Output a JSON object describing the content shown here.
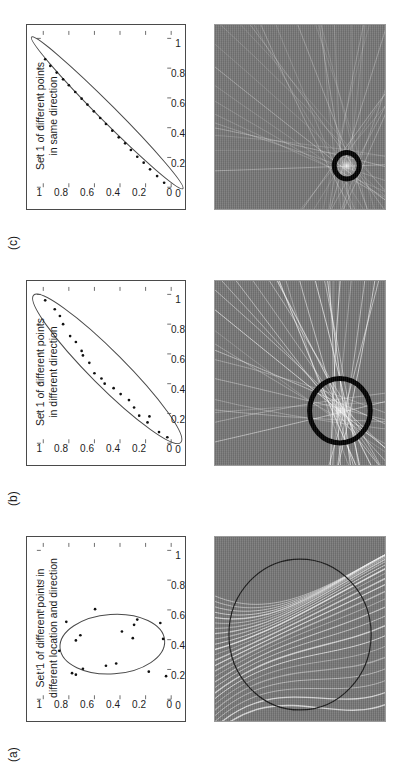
{
  "figure": {
    "type": "scientific-figure-3-panel",
    "orientation": "rotated-90-ccw",
    "background_color": "#ffffff",
    "axis_color": "#4a4a4a",
    "image_background_color": "#787878",
    "streak_color": "#ffffff",
    "marker_circle_color": "#000000"
  },
  "axis": {
    "x_ticks": [
      "0",
      "0.2",
      "0.4",
      "0.6",
      "0.8",
      "1"
    ],
    "y_ticks": [
      "0",
      "0.2",
      "0.4",
      "0.6",
      "0.8",
      "1"
    ],
    "xlim": [
      0,
      1.05
    ],
    "ylim": [
      0,
      1.05
    ]
  },
  "panels": [
    {
      "label": "(a)",
      "caption_line1": "Set 1 of different points in",
      "caption_line2": "different location and direction",
      "ellipse": {
        "cx": 0.37,
        "cy": 0.46,
        "rx": 0.2,
        "ry": 0.41,
        "rot": -4,
        "stroke": "#4a4a4a",
        "width": 1
      },
      "points": [
        [
          0.605,
          0.595
        ],
        [
          0.535,
          0.265
        ],
        [
          0.52,
          0.82
        ],
        [
          0.512,
          0.085
        ],
        [
          0.5,
          0.29
        ],
        [
          0.455,
          0.385
        ],
        [
          0.43,
          0.71
        ],
        [
          0.41,
          0.3
        ],
        [
          0.405,
          0.063
        ],
        [
          0.395,
          0.745
        ],
        [
          0.325,
          0.875
        ],
        [
          0.24,
          0.43
        ],
        [
          0.225,
          0.51
        ],
        [
          0.205,
          0.69
        ],
        [
          0.185,
          0.175
        ],
        [
          0.175,
          0.775
        ],
        [
          0.165,
          0.745
        ],
        [
          0.155,
          0.04
        ]
      ],
      "image": {
        "kind": "backprojection-streaks-large-circle",
        "circle": {
          "cx": 0.47,
          "cy": 0.5,
          "r": 0.41,
          "stroke": "#1a1a1a",
          "width": 1.2
        },
        "focus": null
      }
    },
    {
      "label": "(b)",
      "caption_line1": "Set 1 of different points",
      "caption_line2": "in different direction",
      "ellipse": {
        "cx": 0.5,
        "cy": 0.5,
        "rx": 0.7,
        "ry": 0.135,
        "rot": -45,
        "stroke": "#4a4a4a",
        "width": 1
      },
      "points": [
        [
          0.04,
          0.03
        ],
        [
          0.075,
          0.095
        ],
        [
          0.14,
          0.185
        ],
        [
          0.18,
          0.17
        ],
        [
          0.185,
          0.25
        ],
        [
          0.24,
          0.29
        ],
        [
          0.29,
          0.33
        ],
        [
          0.33,
          0.395
        ],
        [
          0.37,
          0.45
        ],
        [
          0.4,
          0.52
        ],
        [
          0.435,
          0.545
        ],
        [
          0.47,
          0.6
        ],
        [
          0.54,
          0.64
        ],
        [
          0.59,
          0.69
        ],
        [
          0.62,
          0.7
        ],
        [
          0.68,
          0.745
        ],
        [
          0.72,
          0.79
        ],
        [
          0.8,
          0.845
        ],
        [
          0.855,
          0.87
        ],
        [
          0.9,
          0.91
        ],
        [
          0.96,
          0.985
        ]
      ],
      "image": {
        "kind": "converging-streaks-thick-circle",
        "circle": {
          "cx": 0.295,
          "cy": 0.265,
          "r": 0.175,
          "stroke": "#000000",
          "width": 5
        },
        "focus": {
          "cx": 0.295,
          "cy": 0.265
        }
      }
    },
    {
      "label": "(c)",
      "caption_line1": "Set 1 of different points",
      "caption_line2": "in same direction",
      "ellipse": {
        "cx": 0.5,
        "cy": 0.5,
        "rx": 0.72,
        "ry": 0.065,
        "rot": -45,
        "stroke": "#4a4a4a",
        "width": 1
      },
      "points": [
        [
          0.03,
          0.055
        ],
        [
          0.075,
          0.11
        ],
        [
          0.12,
          0.165
        ],
        [
          0.165,
          0.215
        ],
        [
          0.205,
          0.265
        ],
        [
          0.25,
          0.315
        ],
        [
          0.295,
          0.36
        ],
        [
          0.335,
          0.41
        ],
        [
          0.38,
          0.46
        ],
        [
          0.425,
          0.51
        ],
        [
          0.465,
          0.555
        ],
        [
          0.51,
          0.605
        ],
        [
          0.555,
          0.655
        ],
        [
          0.595,
          0.7
        ],
        [
          0.64,
          0.75
        ],
        [
          0.685,
          0.8
        ],
        [
          0.725,
          0.845
        ],
        [
          0.77,
          0.895
        ],
        [
          0.815,
          0.945
        ],
        [
          0.86,
          0.985
        ]
      ],
      "image": {
        "kind": "point-focus-thick-circle",
        "circle": {
          "cx": 0.235,
          "cy": 0.225,
          "r": 0.072,
          "stroke": "#000000",
          "width": 5
        },
        "focus": {
          "cx": 0.235,
          "cy": 0.225
        }
      }
    }
  ]
}
